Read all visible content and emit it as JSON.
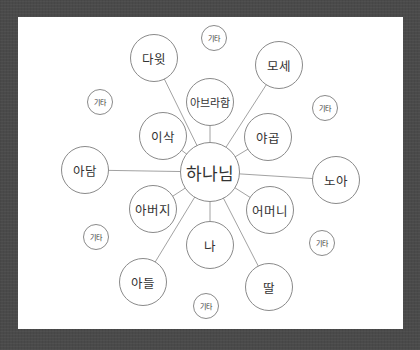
{
  "diagram": {
    "type": "radial-mind-map",
    "colors": {
      "background": "#4a4a4a",
      "card": "#ffffff",
      "stroke": "#8a8a8a",
      "text": "#333333"
    },
    "center": {
      "label": "하나님",
      "x": 210,
      "y": 172,
      "r": 30
    },
    "nodes": [
      {
        "id": "david",
        "label": "다윗",
        "x": 154,
        "y": 58,
        "r": 24,
        "linked": true
      },
      {
        "id": "moses",
        "label": "모세",
        "x": 279,
        "y": 65,
        "r": 24,
        "linked": true
      },
      {
        "id": "abraham",
        "label": "아브라함",
        "x": 210,
        "y": 102,
        "r": 24,
        "linked": true
      },
      {
        "id": "isaac",
        "label": "이삭",
        "x": 163,
        "y": 136,
        "r": 24,
        "linked": true
      },
      {
        "id": "jacob",
        "label": "야곱",
        "x": 268,
        "y": 137,
        "r": 24,
        "linked": true
      },
      {
        "id": "adam",
        "label": "아담",
        "x": 85,
        "y": 170,
        "r": 24,
        "linked": true
      },
      {
        "id": "noah",
        "label": "노아",
        "x": 336,
        "y": 180,
        "r": 24,
        "linked": true
      },
      {
        "id": "father",
        "label": "아버지",
        "x": 153,
        "y": 209,
        "r": 24,
        "linked": true
      },
      {
        "id": "mother",
        "label": "어머니",
        "x": 270,
        "y": 210,
        "r": 24,
        "linked": true
      },
      {
        "id": "me",
        "label": "나",
        "x": 210,
        "y": 245,
        "r": 24,
        "linked": true
      },
      {
        "id": "son",
        "label": "아들",
        "x": 143,
        "y": 282,
        "r": 24,
        "linked": true
      },
      {
        "id": "daughter",
        "label": "딸",
        "x": 269,
        "y": 287,
        "r": 24,
        "linked": true
      },
      {
        "id": "etc-top",
        "label": "기타",
        "x": 214,
        "y": 38,
        "r": 13,
        "linked": false
      },
      {
        "id": "etc-left",
        "label": "기타",
        "x": 100,
        "y": 102,
        "r": 13,
        "linked": false
      },
      {
        "id": "etc-right",
        "label": "기타",
        "x": 325,
        "y": 108,
        "r": 13,
        "linked": false
      },
      {
        "id": "etc-lower-left",
        "label": "기타",
        "x": 96,
        "y": 237,
        "r": 13,
        "linked": false
      },
      {
        "id": "etc-lower-right",
        "label": "기타",
        "x": 322,
        "y": 243,
        "r": 13,
        "linked": false
      },
      {
        "id": "etc-bottom",
        "label": "기타",
        "x": 206,
        "y": 306,
        "r": 13,
        "linked": false
      }
    ]
  }
}
